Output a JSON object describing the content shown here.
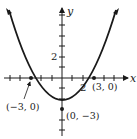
{
  "diagram": {
    "type": "function-graph",
    "function": "y = x^2/3 - 3",
    "axes": {
      "x_label": "x",
      "y_label": "y",
      "x_tick_label": "2",
      "y_tick_label": "2"
    },
    "points": [
      {
        "label": "(−3, 0)",
        "x": -3,
        "y": 0
      },
      {
        "label": "(3, 0)",
        "x": 3,
        "y": 0
      },
      {
        "label": "(0, −3)",
        "x": 0,
        "y": -3
      }
    ],
    "colors": {
      "curve": "#1a1a1a",
      "axes": "#1a1a1a",
      "background": "#ffffff"
    }
  }
}
